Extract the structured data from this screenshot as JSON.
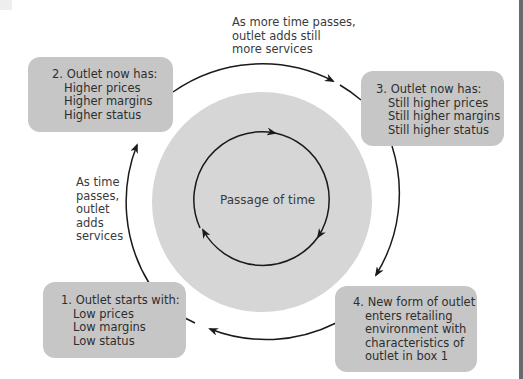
{
  "diagram": {
    "center_label": "Passage of time",
    "boxes": [
      {
        "id": 1,
        "heading": "1. Outlet starts with:",
        "lines": [
          "Low prices",
          "Low margins",
          "Low status"
        ]
      },
      {
        "id": 2,
        "heading": "2. Outlet now has:",
        "lines": [
          "Higher prices",
          "Higher margins",
          "Higher status"
        ]
      },
      {
        "id": 3,
        "heading": "3. Outlet now has:",
        "lines": [
          "Still higher prices",
          "Still higher margins",
          "Still higher status"
        ]
      },
      {
        "id": 4,
        "heading": "4. New form of outlet",
        "lines": [
          "enters retailing",
          "environment with",
          "characteristics of",
          "outlet in box 1"
        ]
      }
    ],
    "notes": {
      "left": [
        "As time",
        "passes,",
        "outlet",
        "adds",
        "services"
      ],
      "top": [
        "As more time passes,",
        "outlet adds still",
        "more services"
      ]
    },
    "colors": {
      "box_fill": "#c6c6c6",
      "disk_fill": "#d6d6d6",
      "arrow": "#1a1a1a",
      "text": "#3a3a3a"
    }
  }
}
